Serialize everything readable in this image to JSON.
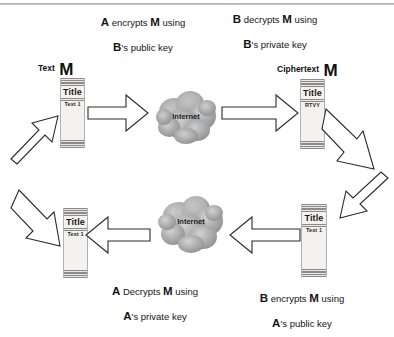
{
  "captions": {
    "top_left": {
      "line1_actor": "A",
      "line1_rest": " encrypts ",
      "line1_msg": "M",
      "line1_tail": " using",
      "line2_actor": "B",
      "line2_rest": "'s public key"
    },
    "top_right": {
      "line1_actor": "B",
      "line1_rest": " decrypts ",
      "line1_msg": "M",
      "line1_tail": " using",
      "line2_actor": "B",
      "line2_rest": "'s private key"
    },
    "bottom_left": {
      "line1_actor": "A",
      "line1_rest": " Decrypts ",
      "line1_msg": "M",
      "line1_tail": " using",
      "line2_actor": "A",
      "line2_rest": "'s private key"
    },
    "bottom_right": {
      "line1_actor": "B",
      "line1_rest": " encrypts ",
      "line1_msg": "M",
      "line1_tail": " using",
      "line2_actor": "A",
      "line2_rest": "'s public key"
    }
  },
  "message_labels": {
    "plaintext_top": {
      "kind": "Text",
      "symbol": "M"
    },
    "ciphertext_top": {
      "kind": "Ciphertext",
      "symbol": "M"
    }
  },
  "documents": {
    "plaintext_top_left": {
      "title": "Title",
      "body": "Text 1"
    },
    "ciphertext_top_right": {
      "title": "Title",
      "body": "RTVY"
    },
    "plaintext_bottom_left": {
      "title": "Title",
      "body": "Text 1"
    },
    "plaintext_bottom_right": {
      "title": "Title",
      "body": "Text 1"
    }
  },
  "clouds": {
    "top": {
      "label": "Internet"
    },
    "bottom": {
      "label": "Internet"
    }
  },
  "colors": {
    "background": "#ffffff",
    "ink": "#141414",
    "arrow_stroke": "#2a2a2a",
    "arrow_fill": "#ffffff",
    "document_fill": "#f3f2f0",
    "document_rule": "#8d8b88",
    "cloud_gray": "#9c9c9c"
  },
  "flow": {
    "steps": [
      "A encrypts M using B's public key",
      "Ciphertext M travels across the Internet",
      "B decrypts M using B's private key",
      "B encrypts M using A's public key",
      "Ciphertext M travels back across the Internet",
      "A Decrypts M using A's private key"
    ]
  }
}
